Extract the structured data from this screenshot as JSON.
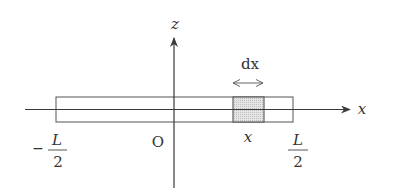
{
  "diagram": {
    "type": "rod-along-x-axis",
    "colors": {
      "line": "#3a3a3a",
      "rod_stroke": "#555555",
      "element_fill": "#dcdcdc",
      "text": "#333333"
    },
    "axes": {
      "x_label": "x",
      "z_label": "z",
      "origin_label": "O"
    },
    "rod": {
      "left_end": {
        "sign": "−",
        "numerator": "L",
        "denominator": "2"
      },
      "right_end": {
        "numerator": "L",
        "denominator": "2"
      }
    },
    "element": {
      "width_label": "dx",
      "position_label": "x"
    }
  }
}
